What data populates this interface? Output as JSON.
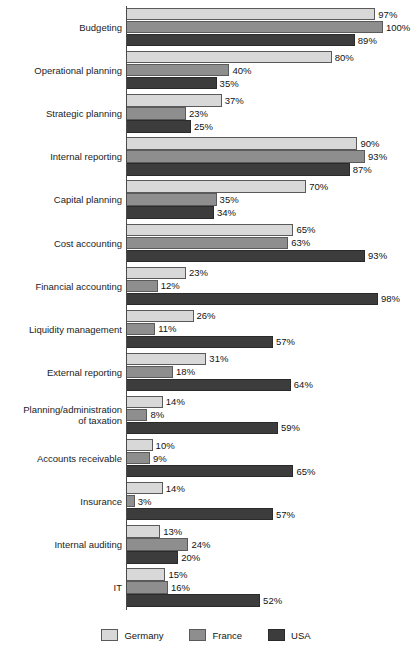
{
  "chart_data": {
    "type": "bar",
    "orientation": "horizontal",
    "title": "",
    "subtitle": "",
    "xlabel": "",
    "ylabel": "",
    "xlim": [
      0,
      100
    ],
    "grid": false,
    "legend_position": "bottom",
    "value_suffix": "%",
    "categories": [
      "Budgeting",
      "Operational planning",
      "Strategic planning",
      "Internal reporting",
      "Capital planning",
      "Cost accounting",
      "Financial accounting",
      "Liquidity management",
      "External reporting",
      "Planning/administration\nof taxation",
      "Accounts receivable",
      "Insurance",
      "Internal auditing",
      "IT"
    ],
    "series": [
      {
        "name": "Germany",
        "color": "#d8d8d8",
        "values": [
          97,
          80,
          37,
          90,
          70,
          65,
          23,
          26,
          31,
          14,
          10,
          14,
          13,
          15
        ],
        "labels": [
          "97%",
          "80%",
          "37%",
          "90%",
          "70%",
          "65%",
          "23%",
          "26%",
          "31%",
          "14%",
          "10%",
          "14%",
          "13%",
          "15%"
        ]
      },
      {
        "name": "France",
        "color": "#8e8e8e",
        "values": [
          100,
          40,
          23,
          93,
          35,
          63,
          12,
          11,
          18,
          8,
          9,
          3,
          24,
          16
        ],
        "labels": [
          "100%",
          "40%",
          "23%",
          "93%",
          "35%",
          "63%",
          "12%",
          "11%",
          "18%",
          "8%",
          "9%",
          "3%",
          "24%",
          "16%"
        ]
      },
      {
        "name": "USA",
        "color": "#3c3c3c",
        "values": [
          89,
          35,
          25,
          87,
          34,
          93,
          98,
          57,
          64,
          59,
          65,
          57,
          20,
          52
        ],
        "labels": [
          "89%",
          "35%",
          "25%",
          "87%",
          "34%",
          "93%",
          "98%",
          "57%",
          "64%",
          "59%",
          "65%",
          "57%",
          "20%",
          "52%"
        ]
      }
    ]
  },
  "legend": {
    "items": [
      {
        "label": "Germany",
        "color": "#d8d8d8"
      },
      {
        "label": "France",
        "color": "#8e8e8e"
      },
      {
        "label": "USA",
        "color": "#3c3c3c"
      }
    ]
  }
}
